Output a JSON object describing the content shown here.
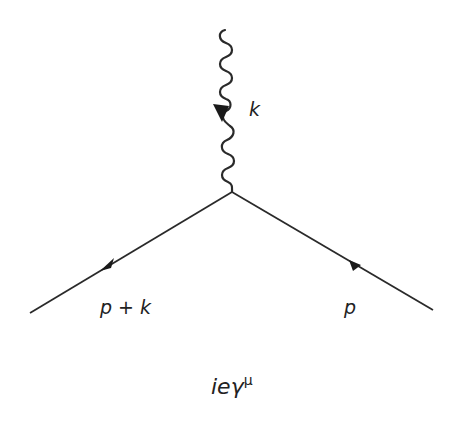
{
  "diagram": {
    "type": "feynman-qed-vertex",
    "stroke_color": "#2a2a2a",
    "vertex": {
      "x": 232,
      "y": 192
    },
    "photon": {
      "label": "k",
      "from": {
        "x": 225,
        "y": 30
      },
      "to": {
        "x": 232,
        "y": 188
      },
      "arrow_direction": "down"
    },
    "fermion_out": {
      "label": "p + k",
      "from": {
        "x": 232,
        "y": 192
      },
      "to": {
        "x": 30,
        "y": 313
      },
      "arrow_direction": "away-from-vertex"
    },
    "fermion_in": {
      "label": "p",
      "from": {
        "x": 433,
        "y": 310
      },
      "to": {
        "x": 232,
        "y": 192
      },
      "arrow_direction": "toward-vertex"
    },
    "vertex_factor": {
      "base": "ieγ",
      "superscript": "μ"
    }
  }
}
